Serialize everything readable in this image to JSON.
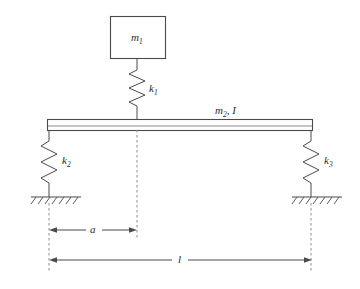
{
  "figure": {
    "background_color": "#ffffff",
    "line_color": "#4a4a4a",
    "dash_color": "#8c8c8c",
    "text_color": "#2b2b2b"
  },
  "labels": {
    "mass_block": "m",
    "mass_block_sub": "1",
    "spring_top": "k",
    "spring_top_sub": "1",
    "spring_left": "k",
    "spring_left_sub": "2",
    "spring_right": "k",
    "spring_right_sub": "3",
    "beam": "m",
    "beam_sub": "2",
    "beam_sep": ", ",
    "beam_inertia": "I",
    "dim_a": "a",
    "dim_l": "l"
  },
  "components": {
    "mass_block": {
      "name": "m1",
      "x": 110,
      "y": 16,
      "width": 55,
      "height": 42
    },
    "spring_k1": {
      "name": "k1",
      "cx": 137,
      "top": 58,
      "bottom": 119,
      "coils": 5,
      "amplitude": 8
    },
    "beam": {
      "name": "m2, I",
      "x": 47,
      "y": 119,
      "width": 266,
      "height": 11,
      "inner_line_y": 126
    },
    "spring_k2": {
      "name": "k2",
      "cx": 49,
      "top": 130,
      "bottom": 197,
      "coils": 5,
      "amplitude": 8
    },
    "spring_k3": {
      "name": "k3",
      "cx": 311,
      "top": 130,
      "bottom": 197,
      "coils": 5,
      "amplitude": 8
    },
    "ground_left": {
      "name": "ground-left",
      "x1": 31,
      "x2": 81,
      "y": 197,
      "hatch_count": 7
    },
    "ground_right": {
      "name": "ground-right",
      "x1": 292,
      "x2": 342,
      "y": 197,
      "hatch_count": 7
    }
  },
  "dimensions": [
    {
      "id": "a",
      "label": "a",
      "x1": 49,
      "x2": 137,
      "y": 230,
      "label_x": 93
    },
    {
      "id": "l",
      "label": "l",
      "x1": 49,
      "x2": 312,
      "y": 260,
      "label_x": 180
    }
  ],
  "extension_lines": [
    {
      "id": "left",
      "x": 49,
      "y1": 203,
      "y2": 272
    },
    {
      "id": "middle",
      "x": 137,
      "y1": 130,
      "y2": 240
    },
    {
      "id": "right",
      "x": 311,
      "y1": 203,
      "y2": 272
    }
  ]
}
